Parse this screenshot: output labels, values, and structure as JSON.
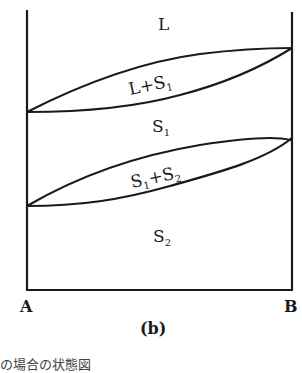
{
  "diagram": {
    "regions": {
      "L": "L",
      "L_S1_main": "L+S",
      "L_S1_sub": "1",
      "S1_main": "S",
      "S1_sub": "1",
      "S1S2_a": "S",
      "S1S2_a_sub": "1",
      "S1S2_b": "+S",
      "S1S2_b_sub": "2",
      "S2_main": "S",
      "S2_sub": "2"
    },
    "axis": {
      "left": "A",
      "right": "B"
    },
    "panel_label": "(b)",
    "caption_partial": "の場合の状態図"
  }
}
